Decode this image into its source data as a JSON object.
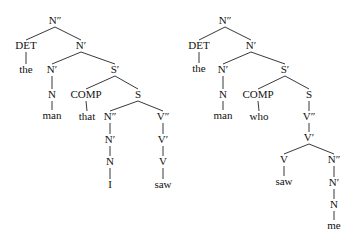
{
  "trees": [
    {
      "name": "left-tree",
      "nodes": [
        {
          "id": "n0",
          "label": "N″",
          "x": 55,
          "y": 24
        },
        {
          "id": "n1",
          "label": "DET",
          "x": 26,
          "y": 49
        },
        {
          "id": "n2",
          "label": "the",
          "x": 26,
          "y": 73
        },
        {
          "id": "n3",
          "label": "N′",
          "x": 81,
          "y": 49
        },
        {
          "id": "n4",
          "label": "N′",
          "x": 52,
          "y": 73
        },
        {
          "id": "n5",
          "label": "N",
          "x": 52,
          "y": 98
        },
        {
          "id": "n6",
          "label": "man",
          "x": 52,
          "y": 119
        },
        {
          "id": "n7",
          "label": "S′",
          "x": 115,
          "y": 73
        },
        {
          "id": "n8",
          "label": "COMP",
          "x": 86,
          "y": 98
        },
        {
          "id": "n9",
          "label": "that",
          "x": 87,
          "y": 120
        },
        {
          "id": "n10",
          "label": "S",
          "x": 138,
          "y": 98
        },
        {
          "id": "n11",
          "label": "N″",
          "x": 110,
          "y": 120
        },
        {
          "id": "n12",
          "label": "N′",
          "x": 110,
          "y": 143
        },
        {
          "id": "n13",
          "label": "N",
          "x": 110,
          "y": 165
        },
        {
          "id": "n14",
          "label": "I",
          "x": 110,
          "y": 188
        },
        {
          "id": "n15",
          "label": "V″",
          "x": 163,
          "y": 120
        },
        {
          "id": "n16",
          "label": "V′",
          "x": 163,
          "y": 143
        },
        {
          "id": "n17",
          "label": "V",
          "x": 163,
          "y": 165
        },
        {
          "id": "n18",
          "label": "saw",
          "x": 163,
          "y": 188
        }
      ],
      "edges": [
        [
          "n0",
          "n1"
        ],
        [
          "n0",
          "n3"
        ],
        [
          "n1",
          "n2"
        ],
        [
          "n3",
          "n4"
        ],
        [
          "n3",
          "n7"
        ],
        [
          "n4",
          "n5"
        ],
        [
          "n5",
          "n6"
        ],
        [
          "n7",
          "n8"
        ],
        [
          "n7",
          "n10"
        ],
        [
          "n8",
          "n9"
        ],
        [
          "n10",
          "n11"
        ],
        [
          "n10",
          "n15"
        ],
        [
          "n11",
          "n12"
        ],
        [
          "n12",
          "n13"
        ],
        [
          "n13",
          "n14"
        ],
        [
          "n15",
          "n16"
        ],
        [
          "n16",
          "n17"
        ],
        [
          "n17",
          "n18"
        ]
      ]
    },
    {
      "name": "right-tree",
      "nodes": [
        {
          "id": "m0",
          "label": "N″",
          "x": 225,
          "y": 24
        },
        {
          "id": "m1",
          "label": "DET",
          "x": 199,
          "y": 49
        },
        {
          "id": "m2",
          "label": "the",
          "x": 199,
          "y": 72
        },
        {
          "id": "m3",
          "label": "N′",
          "x": 251,
          "y": 49
        },
        {
          "id": "m4",
          "label": "N′",
          "x": 223,
          "y": 73
        },
        {
          "id": "m5",
          "label": "N",
          "x": 223,
          "y": 98
        },
        {
          "id": "m6",
          "label": "man",
          "x": 223,
          "y": 119
        },
        {
          "id": "m7",
          "label": "S′",
          "x": 285,
          "y": 73
        },
        {
          "id": "m8",
          "label": "COMP",
          "x": 258,
          "y": 98
        },
        {
          "id": "m9",
          "label": "who",
          "x": 259,
          "y": 120
        },
        {
          "id": "m10",
          "label": "S",
          "x": 309,
          "y": 98
        },
        {
          "id": "m11",
          "label": "V″",
          "x": 309,
          "y": 120
        },
        {
          "id": "m12",
          "label": "V′",
          "x": 309,
          "y": 141
        },
        {
          "id": "m13",
          "label": "V",
          "x": 284,
          "y": 163
        },
        {
          "id": "m14",
          "label": "saw",
          "x": 284,
          "y": 185
        },
        {
          "id": "m15",
          "label": "N″",
          "x": 334,
          "y": 163
        },
        {
          "id": "m16",
          "label": "N′",
          "x": 334,
          "y": 186
        },
        {
          "id": "m17",
          "label": "N",
          "x": 334,
          "y": 208
        },
        {
          "id": "m18",
          "label": "me",
          "x": 334,
          "y": 229
        }
      ],
      "edges": [
        [
          "m0",
          "m1"
        ],
        [
          "m0",
          "m3"
        ],
        [
          "m1",
          "m2"
        ],
        [
          "m3",
          "m4"
        ],
        [
          "m3",
          "m7"
        ],
        [
          "m4",
          "m5"
        ],
        [
          "m5",
          "m6"
        ],
        [
          "m7",
          "m8"
        ],
        [
          "m7",
          "m10"
        ],
        [
          "m8",
          "m9"
        ],
        [
          "m10",
          "m11"
        ],
        [
          "m11",
          "m12"
        ],
        [
          "m12",
          "m13"
        ],
        [
          "m12",
          "m15"
        ],
        [
          "m13",
          "m14"
        ],
        [
          "m15",
          "m16"
        ],
        [
          "m16",
          "m17"
        ],
        [
          "m17",
          "m18"
        ]
      ]
    }
  ]
}
